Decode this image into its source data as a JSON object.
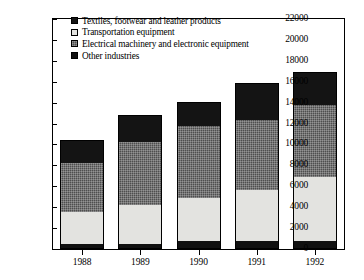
{
  "chart_data": {
    "type": "bar",
    "subtype": "stacked-vertical",
    "title": "",
    "xlabel": "",
    "ylabel": "",
    "categories": [
      "1988",
      "1989",
      "1990",
      "1991",
      "1992"
    ],
    "ylim": [
      0,
      22000
    ],
    "ytick_step": 2000,
    "ytick_labels": [
      "22000",
      "20000",
      "18000",
      "16000",
      "14000",
      "12000",
      "10000",
      "8000",
      "6000",
      "4000",
      "2000",
      "0"
    ],
    "ytick_values": [
      22000,
      20000,
      18000,
      16000,
      14000,
      12000,
      10000,
      8000,
      6000,
      4000,
      2000,
      0
    ],
    "grid": false,
    "legend_position": "top-left-inside",
    "stack_order_bottom_to_top": [
      "Other industries",
      "Transportation equipment",
      "Electrical machinery and electronic equipment",
      "Textiles, footwear and leather products"
    ],
    "series": [
      {
        "name": "Other industries",
        "fill": "solid-black",
        "color": "#101010",
        "values": [
          500,
          500,
          750,
          750,
          750
        ]
      },
      {
        "name": "Transportation equipment",
        "fill": "solid-white",
        "color": "#e3e3e0",
        "values": [
          3000,
          3700,
          4100,
          4900,
          6100
        ]
      },
      {
        "name": "Electrical machinery and electronic equipment",
        "fill": "checkered-gray",
        "color": "#4e4e4e",
        "values": [
          4700,
          6000,
          6900,
          6700,
          6900
        ]
      },
      {
        "name": "Textiles, footwear and leather products",
        "fill": "solid-black",
        "color": "#141414",
        "values": [
          2200,
          2600,
          2350,
          3500,
          3150
        ]
      }
    ],
    "totals": [
      10400,
      12800,
      14100,
      15850,
      16900
    ]
  },
  "legend": {
    "items": [
      {
        "label": "Textiles, footwear and leather products",
        "swatch": "solid-black-swatch"
      },
      {
        "label": "Transportation equipment",
        "swatch": "solid-white-swatch"
      },
      {
        "label": "Electrical machinery and electronic equipment",
        "swatch": "checkered-gray-swatch"
      },
      {
        "label": "Other industries",
        "swatch": "solid-black-swatch"
      }
    ]
  },
  "axes": {
    "y": {
      "ticks": [
        {
          "label": "22000",
          "value": 22000
        },
        {
          "label": "20000",
          "value": 20000
        },
        {
          "label": "18000",
          "value": 18000
        },
        {
          "label": "16000",
          "value": 16000
        },
        {
          "label": "14000",
          "value": 14000
        },
        {
          "label": "12000",
          "value": 12000
        },
        {
          "label": "10000",
          "value": 10000
        },
        {
          "label": "8000",
          "value": 8000
        },
        {
          "label": "6000",
          "value": 6000
        },
        {
          "label": "4000",
          "value": 4000
        },
        {
          "label": "2000",
          "value": 2000
        },
        {
          "label": "0",
          "value": 0
        }
      ]
    },
    "x": {
      "ticks": [
        {
          "label": "1988"
        },
        {
          "label": "1989"
        },
        {
          "label": "1990"
        },
        {
          "label": "1991"
        },
        {
          "label": "1992"
        }
      ]
    }
  },
  "colors": {
    "textiles": "#141414",
    "transportation": "#e3e3e0",
    "electrical": "#4e4e4e",
    "other": "#101010",
    "axis": "#000000",
    "background": "#ffffff"
  }
}
